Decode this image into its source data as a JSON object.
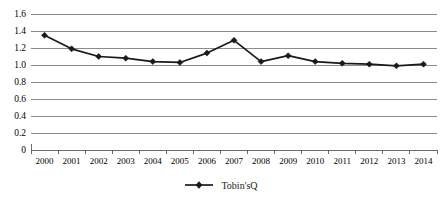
{
  "chart_data": {
    "type": "line",
    "title": "",
    "xlabel": "",
    "ylabel": "",
    "categories": [
      "2000",
      "2001",
      "2002",
      "2003",
      "2004",
      "2005",
      "2006",
      "2007",
      "2008",
      "2009",
      "2010",
      "2011",
      "2012",
      "2013",
      "2014"
    ],
    "series": [
      {
        "name": "Tobin'sQ",
        "marker": "diamond",
        "color": "#1a1a1a",
        "values": [
          1.35,
          1.19,
          1.1,
          1.08,
          1.04,
          1.03,
          1.14,
          1.29,
          1.04,
          1.11,
          1.04,
          1.02,
          1.01,
          0.99,
          1.01
        ]
      }
    ],
    "ylim": [
      0,
      1.6
    ],
    "ytick_labels": [
      "1.6",
      "1.4",
      "1.2",
      "1.0",
      "0.8",
      "0.6",
      "0.4",
      "0.2",
      "0"
    ],
    "ytick_values": [
      1.6,
      1.4,
      1.2,
      1.0,
      0.8,
      0.6,
      0.4,
      0.2,
      0
    ],
    "grid": true,
    "grid_axis": "y",
    "legend_position": "bottom",
    "background": "#ffffff",
    "gridline_color": "#808080"
  },
  "legend": {
    "entries": [
      {
        "label": "Tobin'sQ"
      }
    ]
  }
}
